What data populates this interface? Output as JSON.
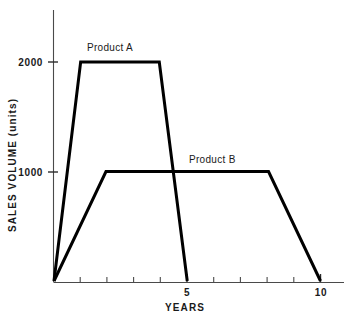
{
  "chart_data": {
    "type": "line",
    "title": "",
    "xlabel": "YEARS",
    "ylabel": "SALES VOLUME (units)",
    "xlim": [
      0,
      10.6
    ],
    "ylim": [
      0,
      2500
    ],
    "grid": false,
    "legend_position": "inline-annotation",
    "x_ticks": [
      1,
      2,
      3,
      4,
      5,
      6,
      7,
      8,
      9,
      10
    ],
    "x_tick_labels": [
      "",
      "",
      "",
      "",
      "5",
      "",
      "",
      "",
      "",
      "10"
    ],
    "y_ticks": [
      1000,
      2000
    ],
    "y_tick_labels": [
      "1000",
      "2000"
    ],
    "series": [
      {
        "name": "Product A",
        "label": "Product A",
        "color": "#000000",
        "points": [
          {
            "x": 0,
            "y": 0
          },
          {
            "x": 1.0,
            "y": 2000
          },
          {
            "x": 3.95,
            "y": 2000
          },
          {
            "x": 5.0,
            "y": 0
          }
        ]
      },
      {
        "name": "Product B",
        "label": "Product B",
        "color": "#000000",
        "points": [
          {
            "x": 0,
            "y": 0
          },
          {
            "x": 1.95,
            "y": 1000
          },
          {
            "x": 8.05,
            "y": 1000
          },
          {
            "x": 10.0,
            "y": 0
          }
        ]
      }
    ],
    "annotations": [
      {
        "text": "Product A",
        "x": 2.0,
        "y": 2330
      },
      {
        "text": "Product B",
        "x": 5.9,
        "y": 1230
      }
    ]
  },
  "axes": {
    "y_label": "SALES VOLUME (units)",
    "x_label": "YEARS",
    "y_tick_2000": "2000",
    "y_tick_1000": "1000",
    "x_tick_5": "5",
    "x_tick_10": "10"
  },
  "labels": {
    "product_a": "Product A",
    "product_b": "Product B"
  },
  "colors": {
    "series_stroke": "#000000",
    "axis": "#4a4a4a",
    "background": "#ffffff",
    "text": "#1a1a1a"
  }
}
